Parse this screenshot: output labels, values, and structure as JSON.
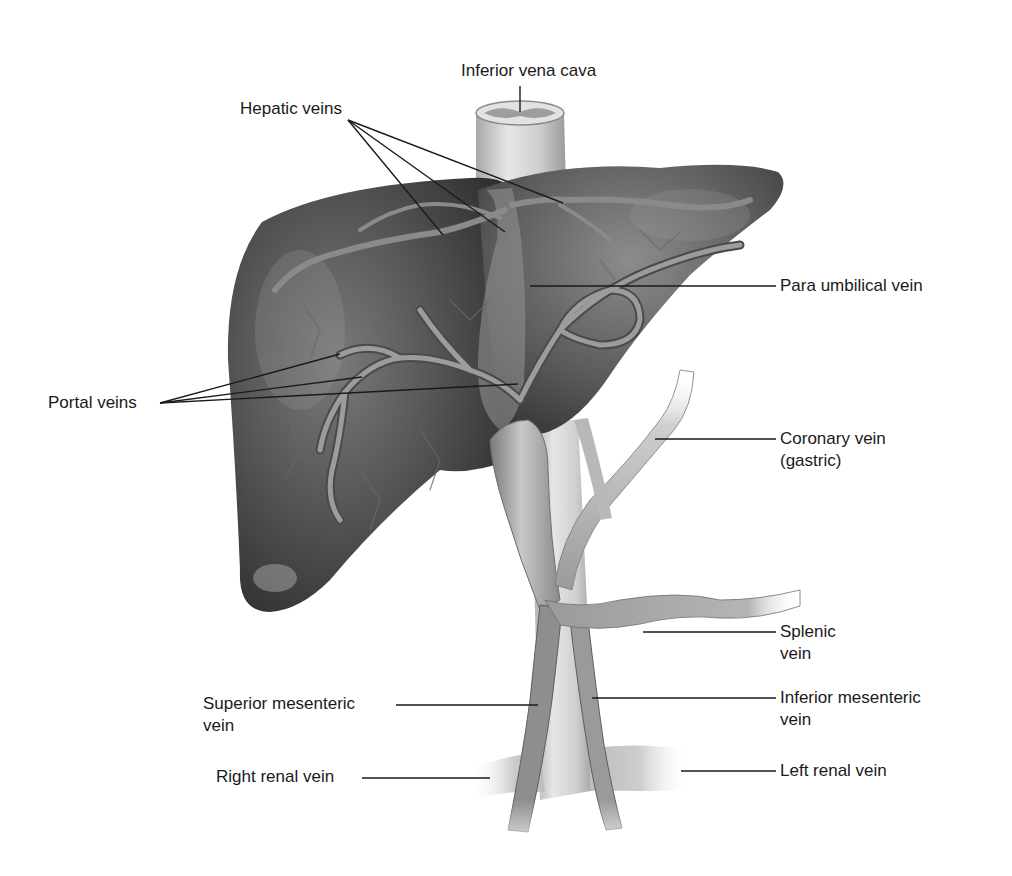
{
  "figure": {
    "colors": {
      "background": "#ffffff",
      "liver_dark": "#3a3a3a",
      "liver_mid": "#5c5c5c",
      "liver_light": "#8a8a8a",
      "vessel_light": "#d8d8d8",
      "vessel_mid": "#a8a8a8",
      "vessel_dark": "#6e6e6e",
      "leader_line": "#1a1a1a",
      "text": "#1a1a1a"
    }
  },
  "labels": {
    "inferior_vena_cava": {
      "text": "Inferior vena cava"
    },
    "hepatic_veins": {
      "text": "Hepatic veins"
    },
    "para_umbilical_vein": {
      "text": "Para umbilical vein"
    },
    "portal_veins": {
      "text": "Portal veins"
    },
    "coronary_vein": {
      "line1": "Coronary vein",
      "line2": "(gastric)"
    },
    "splenic_vein": {
      "line1": "Splenic",
      "line2": "vein"
    },
    "superior_mesenteric_vein": {
      "line1": "Superior mesenteric",
      "line2": "vein"
    },
    "inferior_mesenteric_vein": {
      "line1": "Inferior mesenteric",
      "line2": "vein"
    },
    "right_renal_vein": {
      "text": "Right renal vein"
    },
    "left_renal_vein": {
      "text": "Left renal vein"
    }
  }
}
